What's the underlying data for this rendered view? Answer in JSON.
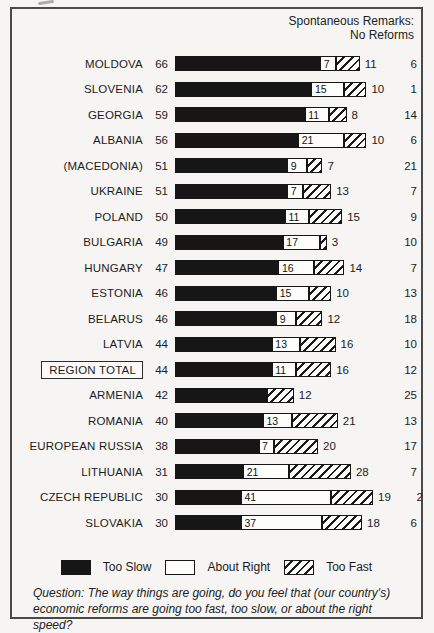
{
  "header": {
    "line1": "Spontaneous Remarks:",
    "line2": "No Reforms"
  },
  "legend": [
    {
      "label": "Too Slow",
      "swatch": "solid-black"
    },
    {
      "label": "About Right",
      "swatch": "white-outline"
    },
    {
      "label": "Too Fast",
      "swatch": "diagonal-hatch"
    }
  ],
  "question": "Question: The way things are going, do you feel that (our country's) economic reforms are going too fast, too slow, or about the right speed?",
  "colors": {
    "too_slow_fill": "#161616",
    "about_right_fill": "#fdfdfc",
    "too_fast_hatch": "#1b1b1b",
    "background": "#f6f5f3",
    "frame_border": "#4a4a4a"
  },
  "chart_data": {
    "type": "bar",
    "orientation": "horizontal",
    "stacked": true,
    "units": "percent",
    "series_names": [
      "Too Slow",
      "About Right",
      "Too Fast"
    ],
    "extra_column": "No Reforms (spontaneous remarks)",
    "legend_position": "bottom",
    "rows": [
      {
        "country": "MOLDOVA",
        "too_slow": 66,
        "about_right": 7,
        "too_fast": 11,
        "no_reforms": 6,
        "boxed": false
      },
      {
        "country": "SLOVENIA",
        "too_slow": 62,
        "about_right": 15,
        "too_fast": 10,
        "no_reforms": 1,
        "boxed": false
      },
      {
        "country": "GEORGIA",
        "too_slow": 59,
        "about_right": 11,
        "too_fast": 8,
        "no_reforms": 14,
        "boxed": false
      },
      {
        "country": "ALBANIA",
        "too_slow": 56,
        "about_right": 21,
        "too_fast": 10,
        "no_reforms": 6,
        "boxed": false
      },
      {
        "country": "(MACEDONIA)",
        "too_slow": 51,
        "about_right": 9,
        "too_fast": 7,
        "no_reforms": 21,
        "boxed": false
      },
      {
        "country": "UKRAINE",
        "too_slow": 51,
        "about_right": 7,
        "too_fast": 13,
        "no_reforms": 7,
        "boxed": false
      },
      {
        "country": "POLAND",
        "too_slow": 50,
        "about_right": 11,
        "too_fast": 15,
        "no_reforms": 9,
        "boxed": false
      },
      {
        "country": "BULGARIA",
        "too_slow": 49,
        "about_right": 17,
        "too_fast": 3,
        "no_reforms": 10,
        "boxed": false
      },
      {
        "country": "HUNGARY",
        "too_slow": 47,
        "about_right": 16,
        "too_fast": 14,
        "no_reforms": 7,
        "boxed": false
      },
      {
        "country": "ESTONIA",
        "too_slow": 46,
        "about_right": 15,
        "too_fast": 10,
        "no_reforms": 13,
        "boxed": false
      },
      {
        "country": "BELARUS",
        "too_slow": 46,
        "about_right": 9,
        "too_fast": 12,
        "no_reforms": 18,
        "boxed": false
      },
      {
        "country": "LATVIA",
        "too_slow": 44,
        "about_right": 13,
        "too_fast": 16,
        "no_reforms": 10,
        "boxed": false
      },
      {
        "country": "REGION TOTAL",
        "too_slow": 44,
        "about_right": 11,
        "too_fast": 16,
        "no_reforms": 12,
        "boxed": true
      },
      {
        "country": "ARMENIA",
        "too_slow": 42,
        "about_right": null,
        "too_fast": 12,
        "no_reforms": 25,
        "boxed": false
      },
      {
        "country": "ROMANIA",
        "too_slow": 40,
        "about_right": 13,
        "too_fast": 21,
        "no_reforms": 13,
        "boxed": false
      },
      {
        "country": "EUROPEAN RUSSIA",
        "too_slow": 38,
        "about_right": 7,
        "too_fast": 20,
        "no_reforms": 17,
        "boxed": false
      },
      {
        "country": "LITHUANIA",
        "too_slow": 31,
        "about_right": 21,
        "too_fast": 28,
        "no_reforms": 7,
        "boxed": false
      },
      {
        "country": "CZECH REPUBLIC",
        "too_slow": 30,
        "about_right": 41,
        "too_fast": 19,
        "no_reforms": 2,
        "boxed": false
      },
      {
        "country": "SLOVAKIA",
        "too_slow": 30,
        "about_right": 37,
        "too_fast": 18,
        "no_reforms": 6,
        "boxed": false
      }
    ]
  }
}
